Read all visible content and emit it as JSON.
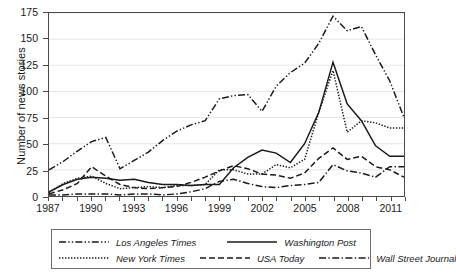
{
  "chart_data": {
    "type": "line",
    "title": "",
    "xlabel": "",
    "ylabel": "Number of news stories",
    "xlim": [
      1987,
      2012
    ],
    "ylim": [
      0,
      175
    ],
    "yticks": [
      0,
      25,
      50,
      75,
      100,
      125,
      150,
      175
    ],
    "xticks_major": [
      1987,
      1990,
      1993,
      1996,
      1999,
      2002,
      2005,
      2008,
      2011
    ],
    "xticks_all": [
      1987,
      1988,
      1989,
      1990,
      1991,
      1992,
      1993,
      1994,
      1995,
      1996,
      1997,
      1998,
      1999,
      2000,
      2001,
      2002,
      2003,
      2004,
      2005,
      2006,
      2007,
      2008,
      2009,
      2010,
      2011,
      2012
    ],
    "grid": "horizontal",
    "legend_position": "below-plot",
    "x": [
      1987,
      1988,
      1989,
      1990,
      1991,
      1992,
      1993,
      1994,
      1995,
      1996,
      1997,
      1998,
      1999,
      2000,
      2001,
      2002,
      2003,
      2004,
      2005,
      2006,
      2007,
      2008,
      2009,
      2010,
      2011,
      2012
    ],
    "series": [
      {
        "name": "Los Angeles Times",
        "dash": "dash-dot-dot",
        "values": [
          25,
          33,
          43,
          52,
          56,
          26,
          34,
          42,
          53,
          62,
          68,
          72,
          93,
          96,
          97,
          81,
          105,
          118,
          127,
          146,
          172,
          158,
          162,
          135,
          110,
          75
        ]
      },
      {
        "name": "Washington Post",
        "dash": "solid",
        "values": [
          4,
          11,
          16,
          18,
          17,
          15,
          16,
          13,
          11,
          11,
          10,
          11,
          11,
          27,
          37,
          44,
          41,
          32,
          50,
          80,
          128,
          88,
          72,
          48,
          38,
          38
        ]
      },
      {
        "name": "New York Times",
        "dash": "dotted",
        "values": [
          3,
          12,
          17,
          19,
          12,
          7,
          8,
          9,
          8,
          10,
          10,
          11,
          25,
          25,
          21,
          21,
          30,
          27,
          35,
          80,
          120,
          61,
          72,
          70,
          65,
          65
        ]
      },
      {
        "name": "USA Today",
        "dash": "dashed",
        "values": [
          2,
          6,
          12,
          28,
          19,
          11,
          8,
          7,
          8,
          9,
          13,
          18,
          24,
          29,
          26,
          21,
          20,
          17,
          22,
          36,
          46,
          35,
          38,
          28,
          25,
          18
        ]
      },
      {
        "name": "Wall Street Journal",
        "dash": "dash-dot",
        "values": [
          1,
          1,
          2,
          2,
          2,
          1,
          2,
          2,
          1,
          2,
          4,
          7,
          14,
          16,
          12,
          9,
          8,
          10,
          11,
          13,
          30,
          24,
          22,
          18,
          28,
          28
        ]
      }
    ]
  },
  "legend": {
    "entries": [
      {
        "label": "Los Angeles Times",
        "dash": "dash-dot-dot"
      },
      {
        "label": "Washington Post",
        "dash": "solid"
      },
      {
        "label": "New York Times",
        "dash": "dotted"
      },
      {
        "label": "USA Today",
        "dash": "dashed"
      },
      {
        "label": "Wall Street Journal",
        "dash": "dash-dot"
      }
    ]
  },
  "colors": {
    "line": "#1a1a1a",
    "frame": "#4a4a4a",
    "grid": "#e6e6e6",
    "background": "#ffffff"
  }
}
